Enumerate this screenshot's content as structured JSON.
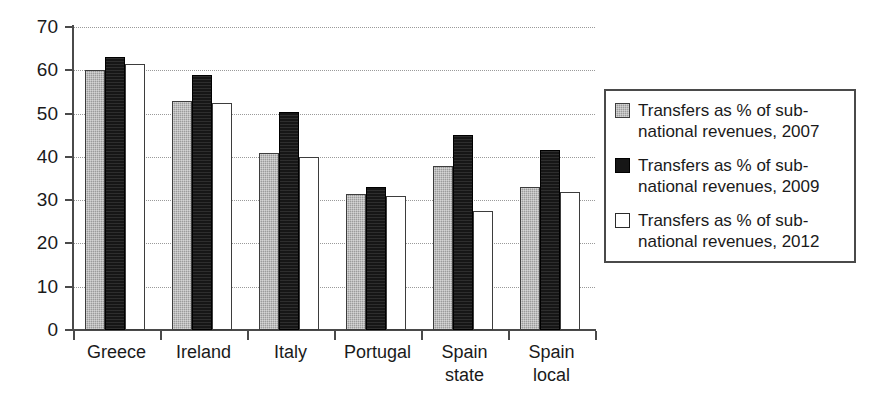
{
  "chart_data": {
    "type": "bar",
    "title": "",
    "subtitle": "",
    "xlabel": "",
    "ylabel": "",
    "ylim": [
      0,
      70
    ],
    "yticks": [
      0,
      10,
      20,
      30,
      40,
      50,
      60,
      70
    ],
    "ytick_labels": [
      "0",
      "10",
      "20",
      "30",
      "40",
      "50",
      "60",
      "70"
    ],
    "grid": true,
    "grid_style": "dotted-horizontal",
    "legend_position": "right",
    "categories": [
      "Greece",
      "Ireland",
      "Italy",
      "Portugal",
      "Spain state",
      "Spain local"
    ],
    "category_lines": [
      [
        "Greece"
      ],
      [
        "Ireland"
      ],
      [
        "Italy"
      ],
      [
        "Portugal"
      ],
      [
        "Spain",
        "state"
      ],
      [
        "Spain",
        "local"
      ]
    ],
    "series": [
      {
        "name": "Transfers as % of sub-national revenues, 2007",
        "legend_label": "Transfers as % of sub-\nnational revenues, 2007",
        "year": "2007",
        "color": "#9b9b9b",
        "swatch": "gray-hatched",
        "values": [
          60,
          53,
          41,
          31.5,
          38,
          33
        ]
      },
      {
        "name": "Transfers as % of sub-national revenues, 2009",
        "legend_label": "Transfers as % of sub-\nnational revenues, 2009",
        "year": "2009",
        "color": "#161616",
        "swatch": "black-filled",
        "values": [
          63,
          59,
          50.3,
          33,
          45,
          41.5
        ]
      },
      {
        "name": "Transfers as % of sub-national revenues, 2012",
        "legend_label": "Transfers as % of sub-\nnational revenues, 2012",
        "year": "2012",
        "color": "#ffffff",
        "swatch": "white-outlined",
        "values": [
          61.5,
          52.5,
          40,
          31,
          27.5,
          32
        ]
      }
    ]
  }
}
